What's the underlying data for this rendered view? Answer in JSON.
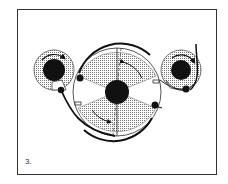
{
  "figure": {
    "label": "3.",
    "colors": {
      "ink": "#111111",
      "shade": "#bbbbbb",
      "paper": "#ffffff",
      "frame": "#333333"
    }
  },
  "components": {
    "left_reel": {
      "name": "supply-reel",
      "cx": 54,
      "cy": 70,
      "r": 20,
      "hub_r": 11
    },
    "center_drum": {
      "name": "center-drum",
      "cx": 117,
      "cy": 92,
      "r": 44,
      "hub_r": 12
    },
    "right_reel": {
      "name": "take-up-reel",
      "cx": 181,
      "cy": 70,
      "r": 20,
      "hub_r": 10
    }
  }
}
